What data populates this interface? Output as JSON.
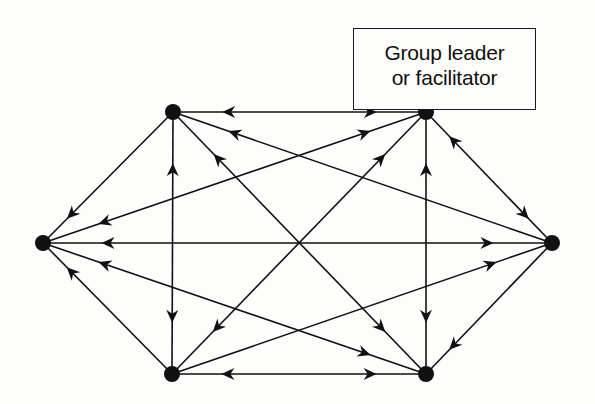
{
  "diagram": {
    "label": {
      "line1": "Group leader",
      "line2": "or facilitator",
      "attached_to": "TR"
    },
    "colors": {
      "ink": "#111111",
      "background": "#fdfdfb"
    },
    "nodes": [
      {
        "id": "TL",
        "name": "member-top-left"
      },
      {
        "id": "TR",
        "name": "group-leader"
      },
      {
        "id": "L",
        "name": "member-left"
      },
      {
        "id": "R",
        "name": "member-right"
      },
      {
        "id": "BL",
        "name": "member-bottom-left"
      },
      {
        "id": "BR",
        "name": "member-bottom-right"
      }
    ],
    "edges": [
      {
        "from": "TL",
        "to": "TR",
        "arrows_to": [
          "TL",
          "TR"
        ]
      },
      {
        "from": "TL",
        "to": "L",
        "arrows_to": [
          "L"
        ]
      },
      {
        "from": "TL",
        "to": "BL",
        "arrows_to": [
          "TL",
          "BL"
        ]
      },
      {
        "from": "TL",
        "to": "BR",
        "arrows_to": [
          "TL",
          "BR"
        ]
      },
      {
        "from": "TL",
        "to": "R",
        "arrows_to": [
          "TL"
        ]
      },
      {
        "from": "TR",
        "to": "L",
        "arrows_to": [
          "TR",
          "L"
        ]
      },
      {
        "from": "TR",
        "to": "BL",
        "arrows_to": [
          "TR",
          "BL"
        ]
      },
      {
        "from": "TR",
        "to": "BR",
        "arrows_to": [
          "TR",
          "BR"
        ]
      },
      {
        "from": "TR",
        "to": "R",
        "arrows_to": [
          "TR",
          "R"
        ]
      },
      {
        "from": "L",
        "to": "R",
        "arrows_to": [
          "L",
          "R"
        ]
      },
      {
        "from": "L",
        "to": "BL",
        "arrows_to": [
          "L"
        ]
      },
      {
        "from": "L",
        "to": "BR",
        "arrows_to": [
          "L",
          "BR"
        ]
      },
      {
        "from": "BL",
        "to": "BR",
        "arrows_to": [
          "BL",
          "BR"
        ]
      },
      {
        "from": "BL",
        "to": "R",
        "arrows_to": [
          "R"
        ]
      },
      {
        "from": "BR",
        "to": "R",
        "arrows_to": [
          "BR"
        ]
      }
    ]
  }
}
